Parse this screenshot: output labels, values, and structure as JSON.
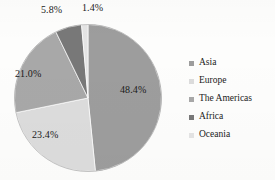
{
  "chart_data": {
    "type": "pie",
    "title": "",
    "categories": [
      "Asia",
      "Europe",
      "The Americas",
      "Africa",
      "Oceania"
    ],
    "values": [
      48.4,
      23.4,
      21.0,
      5.8,
      1.4
    ],
    "value_labels": [
      "48.4%",
      "23.4%",
      "21.0%",
      "5.8%",
      "1.4%"
    ],
    "unit": "%",
    "legend_position": "right",
    "grid": false,
    "start_angle_deg": 0,
    "direction": "clockwise",
    "colors": [
      "#9d9d9d",
      "#dcdcdc",
      "#a8a8a8",
      "#787878",
      "#e4e4e4"
    ],
    "slices": [
      {
        "name": "Asia",
        "value": 48.4,
        "label": "48.4%",
        "color": "#9d9d9d"
      },
      {
        "name": "Europe",
        "value": 23.4,
        "label": "23.4%",
        "color": "#dcdcdc"
      },
      {
        "name": "The Americas",
        "value": 21.0,
        "label": "21.0%",
        "color": "#a8a8a8"
      },
      {
        "name": "Africa",
        "value": 5.8,
        "label": "5.8%",
        "color": "#787878"
      },
      {
        "name": "Oceania",
        "value": 1.4,
        "label": "1.4%",
        "color": "#e4e4e4"
      }
    ]
  },
  "legend": {
    "items": [
      {
        "label": "Asia",
        "swatch_color": "#9d9d9d"
      },
      {
        "label": "Europe",
        "swatch_color": "#dcdcdc"
      },
      {
        "label": "The Americas",
        "swatch_color": "#a8a8a8"
      },
      {
        "label": "Africa",
        "swatch_color": "#787878"
      },
      {
        "label": "Oceania",
        "swatch_color": "#e4e4e4"
      }
    ]
  }
}
